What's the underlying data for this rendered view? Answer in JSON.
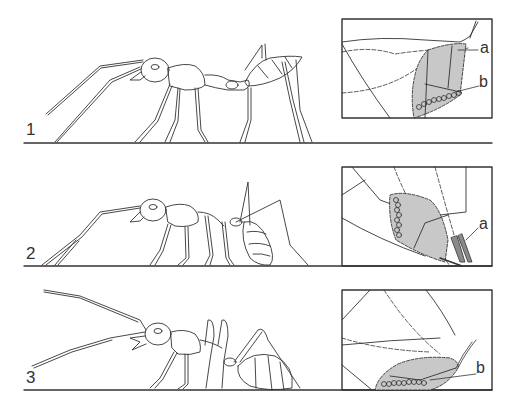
{
  "figure": {
    "panels": [
      {
        "number": "1",
        "posture": "ant standing upright, abdomen raised",
        "inset_labels": [
          "a",
          "b"
        ]
      },
      {
        "number": "2",
        "posture": "ant with abdomen tucked down touching ground, antennae down",
        "inset_labels": [
          "a"
        ]
      },
      {
        "number": "3",
        "posture": "ant with abdomen dragged along ground, antennae raised",
        "inset_labels": [
          "b"
        ]
      }
    ],
    "colors": {
      "line": "#333333",
      "gland_fill": "#c8c8c8",
      "background": "#ffffff"
    }
  }
}
